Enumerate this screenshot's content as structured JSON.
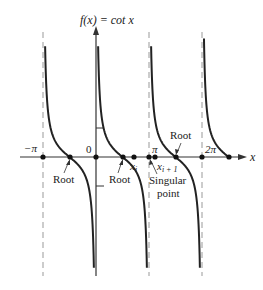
{
  "chart_data": {
    "type": "line",
    "title": "f(x) = cot x",
    "xlabel": "x",
    "ylabel": "f(x) = cot x",
    "function": "cot x",
    "x_tick_labels": [
      "−π",
      "0",
      "π",
      "2π"
    ],
    "x_tick_values": [
      -3.14159,
      0,
      3.14159,
      6.28319
    ],
    "asymptotes": [
      -3.14159,
      0,
      3.14159,
      6.28319
    ],
    "branches": [
      {
        "from": -3.14159,
        "to": 0
      },
      {
        "from": 0,
        "to": 3.14159
      },
      {
        "from": 3.14159,
        "to": 6.28319
      },
      {
        "from": 6.28319,
        "to": 7.85
      }
    ],
    "roots": [
      -1.5708,
      1.5708,
      4.7124,
      7.854
    ],
    "points": [
      {
        "label": "x_i",
        "x": 2.2
      },
      {
        "label": "x_{i+1}",
        "x": 3.5
      }
    ],
    "annotations": [
      {
        "text": "Root",
        "target_x": -1.5708
      },
      {
        "text": "Root",
        "target_x": 1.5708
      },
      {
        "text": "Singular point",
        "target_x": 3.14159
      },
      {
        "text": "Root",
        "target_x": 4.7124
      }
    ],
    "grid": false,
    "legend": null
  },
  "labels": {
    "ylabel": "f(x) = cot x",
    "xlabel": "x",
    "tick_neg_pi": "−π",
    "tick_zero": "0",
    "tick_pi": "π",
    "tick_2pi": "2π",
    "root1": "Root",
    "root2": "Root",
    "root3": "Root",
    "singular_line1": "Singular",
    "singular_line2": "point",
    "xi_main": "x",
    "xi_sub": "i",
    "xi1_main": "x",
    "xi1_sub": "i + 1"
  }
}
